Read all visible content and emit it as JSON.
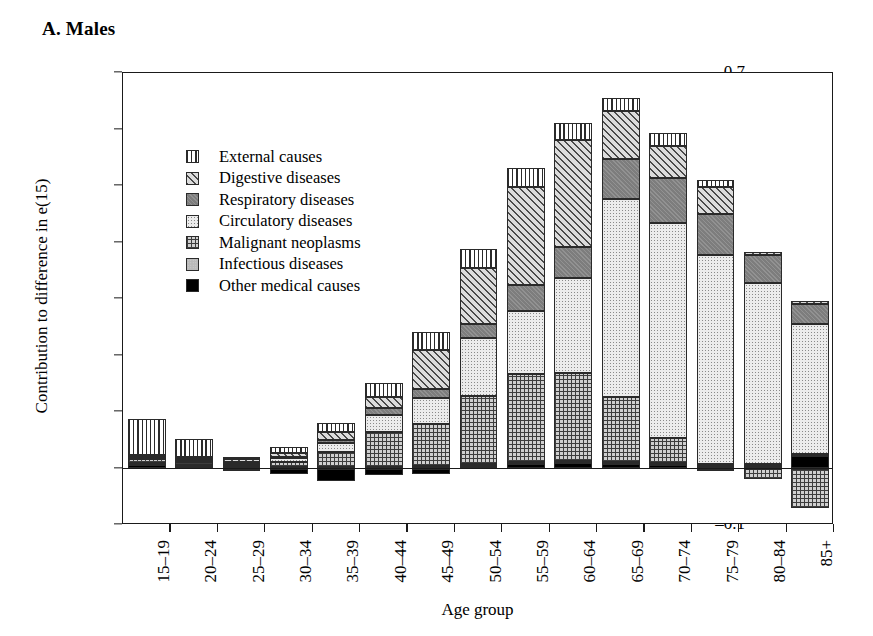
{
  "panel": {
    "title": "A. Males"
  },
  "axes": {
    "ylabel": "Contribution to difference in e(15)",
    "xlabel": "Age group",
    "yticks": [
      "0.7",
      "0.6",
      "0.5",
      "0.4",
      "0.3",
      "0.2",
      "0.1",
      "0",
      "–0.1"
    ],
    "ytick_values": [
      0.7,
      0.6,
      0.5,
      0.4,
      0.3,
      0.2,
      0.1,
      0,
      -0.1
    ]
  },
  "legend": {
    "items": [
      {
        "label": "External causes",
        "pattern": "vertical-lines",
        "key": "external"
      },
      {
        "label": "Digestive diseases",
        "pattern": "diagonal-hatch",
        "key": "digestive"
      },
      {
        "label": "Respiratory diseases",
        "pattern": "dark-gray-solid",
        "key": "respiratory"
      },
      {
        "label": "Circulatory diseases",
        "pattern": "light-dots",
        "key": "circulatory"
      },
      {
        "label": "Malignant neoplasms",
        "pattern": "grid-crosshatch",
        "key": "malignant"
      },
      {
        "label": "Infectious diseases",
        "pattern": "light-gray-solid",
        "key": "infectious"
      },
      {
        "label": "Other medical causes",
        "pattern": "black-solid",
        "key": "other"
      }
    ]
  },
  "chart_data": {
    "type": "bar",
    "subtype": "stacked-bar-with-negatives",
    "title": "A. Males",
    "xlabel": "Age group",
    "ylabel": "Contribution to difference in e(15)",
    "ylim": [
      -0.1,
      0.7
    ],
    "ytick_step": 0.1,
    "grid": false,
    "legend_position": "inside-upper-left",
    "categories": [
      "15–19",
      "20–24",
      "25–29",
      "30–34",
      "35–39",
      "40–44",
      "45–49",
      "50–54",
      "55–59",
      "60–64",
      "65–69",
      "70–74",
      "75–79",
      "80–84",
      "85+"
    ],
    "stack_order_from_zero": [
      "other",
      "infectious",
      "malignant",
      "circulatory",
      "respiratory",
      "digestive",
      "external"
    ],
    "series": [
      {
        "name": "Other medical causes",
        "key": "other",
        "values": [
          0.006,
          0.004,
          -0.004,
          -0.01,
          -0.022,
          -0.012,
          -0.01,
          0.004,
          0.008,
          0.01,
          0.008,
          0.006,
          0.004,
          0.004,
          0.022
        ]
      },
      {
        "name": "Infectious diseases",
        "key": "infectious",
        "values": [
          0.004,
          0.003,
          0.002,
          0.002,
          0.003,
          0.003,
          0.004,
          0.004,
          0.004,
          0.004,
          0.004,
          0.004,
          0.004,
          0.004,
          0.004
        ]
      },
      {
        "name": "Malignant neoplasms",
        "key": "malignant",
        "values": [
          0.006,
          0.005,
          0.005,
          0.01,
          0.026,
          0.062,
          0.075,
          0.12,
          0.155,
          0.155,
          0.115,
          0.044,
          -0.004,
          -0.018,
          -0.07
        ]
      },
      {
        "name": "Circulatory diseases",
        "key": "circulatory",
        "values": [
          0.003,
          0.003,
          0.003,
          0.006,
          0.016,
          0.03,
          0.046,
          0.103,
          0.112,
          0.168,
          0.35,
          0.38,
          0.37,
          0.32,
          0.23
        ]
      },
      {
        "name": "Respiratory diseases",
        "key": "respiratory",
        "values": [
          0.002,
          0.002,
          0.002,
          0.003,
          0.006,
          0.012,
          0.016,
          0.024,
          0.045,
          0.055,
          0.07,
          0.08,
          0.072,
          0.05,
          0.035
        ]
      },
      {
        "name": "Digestive diseases",
        "key": "digestive",
        "values": [
          0.003,
          0.004,
          0.004,
          0.006,
          0.014,
          0.02,
          0.068,
          0.1,
          0.175,
          0.19,
          0.086,
          0.056,
          0.048,
          0.006,
          0.005
        ]
      },
      {
        "name": "External causes",
        "key": "external",
        "values": [
          0.064,
          0.031,
          0.005,
          0.011,
          0.016,
          0.025,
          0.033,
          0.033,
          0.033,
          0.03,
          0.023,
          0.024,
          0.012,
          0.0,
          0.0
        ]
      }
    ]
  }
}
